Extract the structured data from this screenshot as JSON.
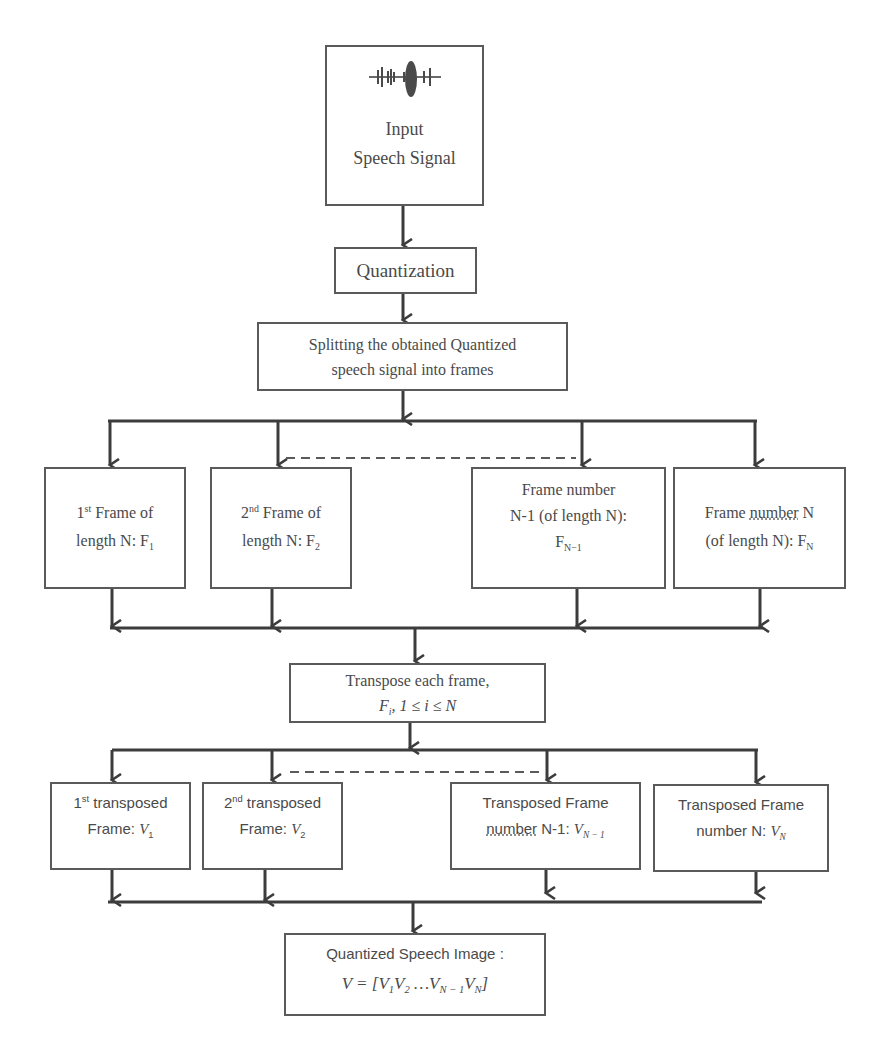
{
  "diagram": {
    "type": "flowchart",
    "colors": {
      "line": "#3c3c3c",
      "box_border": "#5a5a5a",
      "text": "#4a4a4a",
      "background": "#ffffff"
    },
    "nodes": {
      "input": {
        "icon": "waveform-icon",
        "line1": "Input",
        "line2": "Speech Signal"
      },
      "quantization": {
        "label": "Quantization"
      },
      "split": {
        "line1": "Splitting the obtained Quantized",
        "line2": "speech signal into frames"
      },
      "frames": [
        {
          "ord": "1",
          "ord_sup": "st",
          "line1_rest": " Frame of",
          "line2": "length N: F",
          "sub": "1"
        },
        {
          "ord": "2",
          "ord_sup": "nd",
          "line1_rest": " Frame of",
          "line2": "length N: F",
          "sub": "2"
        },
        {
          "line1": "Frame number",
          "line2": "N-1 (of length N):",
          "line3": "F",
          "sub": "N−1"
        },
        {
          "line1_a": "Frame ",
          "line1_b": "number",
          "line1_c": " N",
          "line2": "(of length N): F",
          "sub": "N"
        }
      ],
      "transpose": {
        "line1": "Transpose each frame,",
        "math_F": "F",
        "math_sub": "i",
        "math_rest": ", 1 ≤ i ≤ N"
      },
      "transposed": [
        {
          "ord": "1",
          "ord_sup": "st",
          "line1_rest": " transposed",
          "line2": "Frame: ",
          "var": "V",
          "sub": "1"
        },
        {
          "ord": "2",
          "ord_sup": "nd",
          "line1_rest": " transposed",
          "line2": "Frame: ",
          "var": "V",
          "sub": "2"
        },
        {
          "line1": "Transposed Frame",
          "line2_a": "number",
          "line2_b": " N-1: ",
          "var": "V",
          "sub": "N − 1"
        },
        {
          "line1": "Transposed Frame",
          "line2": "number N: ",
          "var": "V",
          "sub": "N"
        }
      ],
      "final": {
        "line1": "Quantized Speech Image :",
        "eq_lhs": "V = [",
        "terms": [
          {
            "v": "V",
            "sub": "1"
          },
          {
            "v": "V",
            "sub": "2"
          },
          {
            "v": " …V",
            "sub": "N − 1"
          },
          {
            "v": "V",
            "sub": "N"
          }
        ],
        "eq_rhs": "]"
      }
    },
    "edges": [
      "input → quantization",
      "quantization → split",
      "split → frame 1, frame 2, …, frame N-1, frame N",
      "frames → transpose",
      "transpose → transposed 1, transposed 2, …, transposed N-1, transposed N",
      "transposed frames → final"
    ]
  }
}
